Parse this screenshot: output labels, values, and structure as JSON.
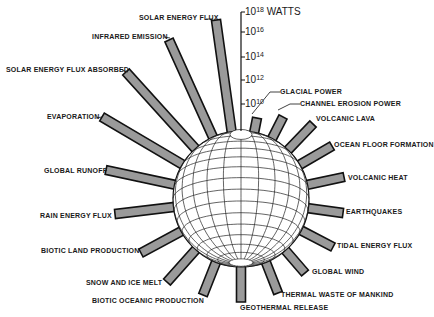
{
  "chart_data": {
    "type": "radial-bar",
    "title": "",
    "unit_label": "WATTS",
    "axis": {
      "scale": "log10",
      "ticks": [
        {
          "exp": "10",
          "label": "10^10"
        },
        {
          "exp": "12",
          "label": "10^12"
        },
        {
          "exp": "14",
          "label": "10^14"
        },
        {
          "exp": "16",
          "label": "10^16"
        },
        {
          "exp": "18",
          "label": "10^18"
        }
      ],
      "top_label": "WATTS"
    },
    "bars": [
      {
        "label": "SOLAR ENERGY FLUX",
        "log_watts": 17.2
      },
      {
        "label": "INFRARED EMISSION",
        "log_watts": 17.1
      },
      {
        "label": "SOLAR ENERGY FLUX ABSORBED",
        "log_watts": 17.0
      },
      {
        "label": "EVAPORATION",
        "log_watts": 16.6
      },
      {
        "label": "GLOBAL RUNOFF",
        "log_watts": 15.5
      },
      {
        "label": "RAIN ENERGY FLUX",
        "log_watts": 15.7
      },
      {
        "label": "BIOTIC LAND PRODUCTION",
        "log_watts": 14.0
      },
      {
        "label": "SNOW AND ICE MELT",
        "log_watts": 14.0
      },
      {
        "label": "BIOTIC OCEANIC PRODUCTION",
        "log_watts": 14.1
      },
      {
        "label": "GEOTHERMAL RELEASE",
        "log_watts": 13.5
      },
      {
        "label": "THERMAL WASTE OF MANKIND",
        "log_watts": 13.0
      },
      {
        "label": "GLOBAL WIND",
        "log_watts": 12.8
      },
      {
        "label": "TIDAL ENERGY FLUX",
        "log_watts": 12.5
      },
      {
        "label": "EARTHQUAKES",
        "log_watts": 11.5
      },
      {
        "label": "VOLCANIC HEAT",
        "log_watts": 12.0
      },
      {
        "label": "OCEAN FLOOR FORMATION",
        "log_watts": 11.5
      },
      {
        "label": "VOLCANIC LAVA",
        "log_watts": 11.0
      },
      {
        "label": "CHANNEL EROSION POWER",
        "log_watts": 10.0
      },
      {
        "label": "GLACIAL POWER",
        "log_watts": 9.5
      }
    ]
  },
  "axis_labels": {
    "t18": {
      "base": "10",
      "exp": "18",
      "unit": " WATTS"
    },
    "t16": {
      "base": "10",
      "exp": "16"
    },
    "t14": {
      "base": "10",
      "exp": "14"
    },
    "t12": {
      "base": "10",
      "exp": "12"
    },
    "t10": {
      "base": "10",
      "exp": "10"
    }
  },
  "labels": {
    "solar_energy_flux": "SOLAR ENERGY FLUX",
    "infrared_emission": "INFRARED EMISSION",
    "solar_energy_flux_absorbed": "SOLAR ENERGY FLUX ABSORBED",
    "evaporation": "EVAPORATION",
    "global_runoff": "GLOBAL RUNOFF",
    "rain_energy_flux": "RAIN ENERGY FLUX",
    "biotic_land_production": "BIOTIC LAND PRODUCTION",
    "snow_and_ice_melt": "SNOW AND ICE MELT",
    "biotic_oceanic_production": "BIOTIC OCEANIC PRODUCTION",
    "geothermal_release": "GEOTHERMAL RELEASE",
    "thermal_waste": "THERMAL WASTE OF MANKIND",
    "global_wind": "GLOBAL WIND",
    "tidal_energy_flux": "TIDAL ENERGY FLUX",
    "earthquakes": "EARTHQUAKES",
    "volcanic_heat": "VOLCANIC HEAT",
    "ocean_floor_formation": "OCEAN FLOOR FORMATION",
    "volcanic_lava": "VOLCANIC LAVA",
    "channel_erosion_power": "CHANNEL EROSION POWER",
    "glacial_power": "GLACIAL POWER"
  },
  "colors": {
    "bar_fill": "#9a9a9a",
    "bar_stroke": "#111111",
    "globe_fill": "#ffffff",
    "grid_line": "#222222",
    "background": "#ffffff"
  }
}
